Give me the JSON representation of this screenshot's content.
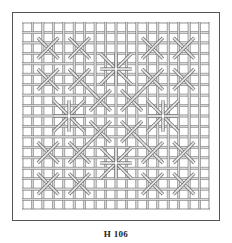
{
  "figure": {
    "caption": "H 106",
    "pattern": {
      "type": "lattice-screen",
      "grid_cells": 18,
      "line_color": "#6a6a6a",
      "background": "#ffffff",
      "large_star_centers": [
        [
          9,
          4.5
        ],
        [
          4.5,
          9
        ],
        [
          13.5,
          9
        ],
        [
          9,
          13.5
        ]
      ],
      "small_cross_centers": [
        [
          2.5,
          2.5
        ],
        [
          5.5,
          2.5
        ],
        [
          12.5,
          2.5
        ],
        [
          15.5,
          2.5
        ],
        [
          2.5,
          5.5
        ],
        [
          5.5,
          5.5
        ],
        [
          12.5,
          5.5
        ],
        [
          15.5,
          5.5
        ],
        [
          7.5,
          7.5
        ],
        [
          10.5,
          7.5
        ],
        [
          7.5,
          10.5
        ],
        [
          10.5,
          10.5
        ],
        [
          2.5,
          12.5
        ],
        [
          5.5,
          12.5
        ],
        [
          12.5,
          12.5
        ],
        [
          15.5,
          12.5
        ],
        [
          2.5,
          15.5
        ],
        [
          5.5,
          15.5
        ],
        [
          12.5,
          15.5
        ],
        [
          15.5,
          15.5
        ]
      ]
    }
  }
}
